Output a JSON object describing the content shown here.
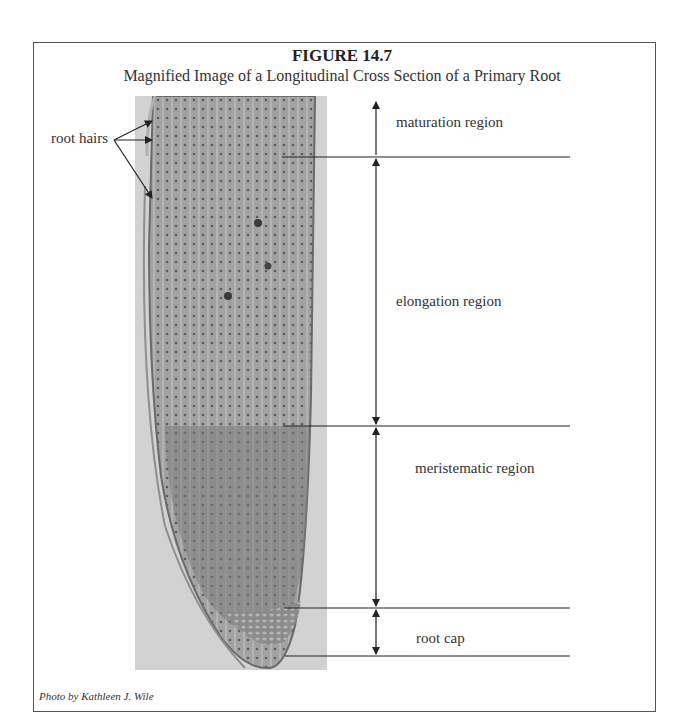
{
  "figure": {
    "number": "FIGURE 14.7",
    "title": "Magnified Image of a Longitudinal Cross Section of a Primary Root",
    "credit": "Photo by Kathleen J. Wile"
  },
  "photo": {
    "subject": "longitudinal-section-primary-root-micrograph",
    "tone": "grayscale"
  },
  "labels": {
    "root_hairs": "root hairs",
    "maturation": "maturation region",
    "elongation": "elongation region",
    "meristematic": "meristematic region",
    "root_cap": "root cap"
  },
  "colors": {
    "line": "#222222",
    "border": "#555555",
    "photo_bg": "#d2d2d2",
    "tissue": "#9a9a9a"
  }
}
